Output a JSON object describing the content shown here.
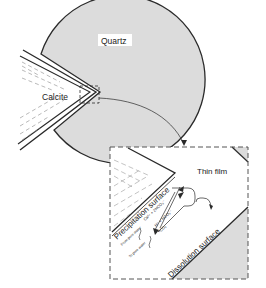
{
  "labels": {
    "quartz": "Quartz",
    "calcite": "Calcite",
    "thin_film": "Thin film",
    "precipitation_surface": "Precipitation surface",
    "dissolution_surface": "Dissolution surface",
    "precip_species": "Ca²⁺ + 2HCO₃⁻",
    "dissol_species_1": "H⁺ + HCO₃⁻",
    "dissol_species_2": "²CO₃",
    "from_pore_water": "From pore water",
    "to_pore_water": "To pore water"
  },
  "colors": {
    "quartz_fill": "#dcdcdc",
    "line": "#2a2a2a",
    "background": "#ffffff"
  }
}
